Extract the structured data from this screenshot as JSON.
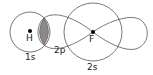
{
  "diagram": {
    "atoms": [
      {
        "symbol": "H",
        "orbital": "1s"
      },
      {
        "symbol": "F",
        "orbital": "2s"
      }
    ],
    "bond_orbital": "2p",
    "colors": {
      "stroke": "#555555",
      "overlap": "#8a8a8a",
      "nucleus": "#000000"
    }
  }
}
